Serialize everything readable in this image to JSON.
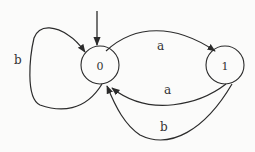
{
  "diagram": {
    "type": "finite-automaton",
    "colors": {
      "stroke": "#2b2b2b",
      "background": "#fbfbfa",
      "text": "#333333"
    },
    "states": [
      {
        "id": "0",
        "label": "0",
        "start": true
      },
      {
        "id": "1",
        "label": "1",
        "start": false
      }
    ],
    "transitions": [
      {
        "from": "0",
        "to": "0",
        "label": "b"
      },
      {
        "from": "0",
        "to": "1",
        "label": "a"
      },
      {
        "from": "1",
        "to": "0",
        "label": "a"
      },
      {
        "from": "1",
        "to": "0",
        "label": "b"
      }
    ]
  }
}
